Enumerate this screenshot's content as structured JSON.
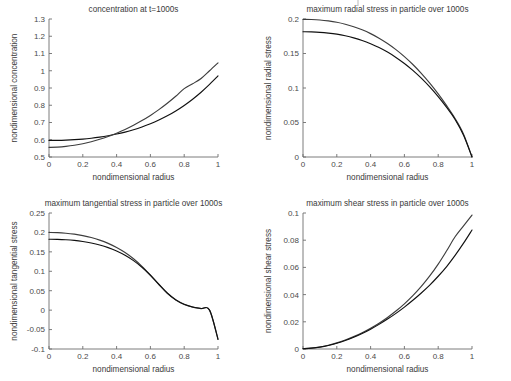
{
  "figure": {
    "width": 511,
    "height": 381,
    "background": "#ffffff",
    "layout": "2x2 subplot grid",
    "line_colors": [
      "#101010",
      "#3d3d3d"
    ]
  },
  "chart_data": [
    {
      "id": "concentration",
      "type": "line",
      "title": "concentration at t=1000s",
      "xlabel": "nondimensional radius",
      "ylabel": "nondimensional concentration",
      "xlim": [
        0,
        1
      ],
      "ylim": [
        0.5,
        1.3
      ],
      "xticks": [
        0,
        0.2,
        0.4,
        0.6,
        0.8,
        1
      ],
      "xticklabels": [
        "0",
        "0.2",
        "0.4",
        "0.6",
        "0.8",
        "1"
      ],
      "yticks": [
        0.5,
        0.6,
        0.7,
        0.8,
        0.9,
        1.0,
        1.1,
        1.2,
        1.3
      ],
      "yticklabels": [
        "0.5",
        "0.6",
        "0.7",
        "0.8",
        "0.9",
        "1",
        "1.1",
        "1.2",
        "1.3"
      ],
      "grid": false,
      "legend": "none",
      "x": [
        0,
        0.05,
        0.1,
        0.15,
        0.2,
        0.25,
        0.3,
        0.35,
        0.4,
        0.45,
        0.5,
        0.55,
        0.6,
        0.65,
        0.7,
        0.75,
        0.8,
        0.85,
        0.9,
        0.95,
        1
      ],
      "series": [
        {
          "name": "model-a",
          "color": "#101010",
          "values": [
            0.596,
            0.5965,
            0.598,
            0.6005,
            0.604,
            0.609,
            0.6155,
            0.6235,
            0.633,
            0.6445,
            0.658,
            0.674,
            0.6925,
            0.714,
            0.7385,
            0.767,
            0.799,
            0.835,
            0.8755,
            0.9205,
            0.97
          ]
        },
        {
          "name": "model-b",
          "color": "#3d3d3d",
          "values": [
            0.556,
            0.5575,
            0.5615,
            0.568,
            0.577,
            0.5885,
            0.6025,
            0.619,
            0.638,
            0.6595,
            0.684,
            0.711,
            0.741,
            0.7745,
            0.8115,
            0.852,
            0.8965,
            0.9245,
            0.9555,
            1.0,
            1.046
          ]
        }
      ]
    },
    {
      "id": "radial-stress",
      "type": "line",
      "title": "maximum radial stress in particle over 1000s",
      "xlabel": "nondimensional radius",
      "ylabel": "nondimensional radial stress",
      "xlim": [
        0,
        1
      ],
      "ylim": [
        0,
        0.2
      ],
      "xticks": [
        0,
        0.2,
        0.4,
        0.6,
        0.8,
        1
      ],
      "xticklabels": [
        "0",
        "0.2",
        "0.4",
        "0.6",
        "0.8",
        "1"
      ],
      "yticks": [
        0,
        0.05,
        0.1,
        0.15,
        0.2
      ],
      "yticklabels": [
        "0",
        "0.05",
        "0.1",
        "0.15",
        "0.2"
      ],
      "grid": false,
      "legend": "none",
      "x": [
        0,
        0.05,
        0.1,
        0.15,
        0.2,
        0.25,
        0.3,
        0.35,
        0.4,
        0.45,
        0.5,
        0.55,
        0.6,
        0.65,
        0.7,
        0.75,
        0.8,
        0.85,
        0.9,
        0.95,
        1
      ],
      "series": [
        {
          "name": "model-a",
          "color": "#3d3d3d",
          "values": [
            0.1995,
            0.1993,
            0.1986,
            0.1972,
            0.1952,
            0.1924,
            0.1888,
            0.1843,
            0.1788,
            0.1722,
            0.1645,
            0.1556,
            0.1455,
            0.1341,
            0.1213,
            0.1071,
            0.0915,
            0.0744,
            0.0558,
            0.0331,
            0.0
          ]
        },
        {
          "name": "model-b",
          "color": "#101010",
          "values": [
            0.1815,
            0.1813,
            0.1807,
            0.1796,
            0.178,
            0.1757,
            0.1727,
            0.1689,
            0.1642,
            0.1586,
            0.152,
            0.1443,
            0.1355,
            0.1255,
            0.1142,
            0.1016,
            0.0875,
            0.0718,
            0.0544,
            0.0314,
            0.0
          ]
        }
      ]
    },
    {
      "id": "tangential-stress",
      "type": "line",
      "title": "maximum tangential stress in particle over 1000s",
      "xlabel": "nondimensional radius",
      "ylabel": "nondimensional tangential stress",
      "xlim": [
        0,
        1
      ],
      "ylim": [
        -0.1,
        0.25
      ],
      "xticks": [
        0,
        0.2,
        0.4,
        0.6,
        0.8,
        1
      ],
      "xticklabels": [
        "0",
        "0.2",
        "0.4",
        "0.6",
        "0.8",
        "1"
      ],
      "yticks": [
        -0.1,
        -0.05,
        0,
        0.05,
        0.1,
        0.15,
        0.2,
        0.25
      ],
      "yticklabels": [
        "-0.1",
        "-0.05",
        "0",
        "0.05",
        "0.1",
        "0.15",
        "0.2",
        "0.25"
      ],
      "grid": false,
      "legend": "none",
      "x": [
        0,
        0.05,
        0.1,
        0.15,
        0.2,
        0.25,
        0.3,
        0.35,
        0.4,
        0.45,
        0.5,
        0.55,
        0.6,
        0.65,
        0.7,
        0.75,
        0.8,
        0.85,
        0.9,
        0.95,
        1
      ],
      "series": [
        {
          "name": "model-a",
          "color": "#3d3d3d",
          "values": [
            0.2,
            0.1995,
            0.198,
            0.1955,
            0.1918,
            0.1868,
            0.1802,
            0.1718,
            0.1612,
            0.1482,
            0.1322,
            0.1128,
            0.0902,
            0.0658,
            0.043,
            0.0258,
            0.0145,
            0.0078,
            0.004,
            0.0,
            -0.075
          ]
        },
        {
          "name": "model-b",
          "color": "#101010",
          "values": [
            0.1825,
            0.1822,
            0.1812,
            0.1794,
            0.1766,
            0.1727,
            0.1676,
            0.1609,
            0.1522,
            0.1412,
            0.1275,
            0.1104,
            0.0898,
            0.0666,
            0.0442,
            0.0268,
            0.0152,
            0.0082,
            0.0042,
            0.0,
            -0.075
          ]
        }
      ]
    },
    {
      "id": "shear-stress",
      "type": "line",
      "title": "maximum shear stress in particle over 1000s",
      "xlabel": "nondimensional radius",
      "ylabel": "nondimensional shear stress",
      "xlim": [
        0,
        1
      ],
      "ylim": [
        0,
        0.1
      ],
      "xticks": [
        0,
        0.2,
        0.4,
        0.6,
        0.8,
        1
      ],
      "xticklabels": [
        "0",
        "0.2",
        "0.4",
        "0.6",
        "0.8",
        "1"
      ],
      "yticks": [
        0,
        0.02,
        0.04,
        0.06,
        0.08,
        0.1
      ],
      "yticklabels": [
        "0",
        "0.02",
        "0.04",
        "0.06",
        "0.08",
        "0.1"
      ],
      "grid": false,
      "legend": "none",
      "x": [
        0,
        0.05,
        0.1,
        0.15,
        0.2,
        0.25,
        0.3,
        0.35,
        0.4,
        0.45,
        0.5,
        0.55,
        0.6,
        0.65,
        0.7,
        0.75,
        0.8,
        0.85,
        0.9,
        0.95,
        1
      ],
      "series": [
        {
          "name": "model-a",
          "color": "#3d3d3d",
          "values": [
            0.0002,
            0.0006,
            0.0015,
            0.0028,
            0.0045,
            0.0066,
            0.0091,
            0.012,
            0.0153,
            0.019,
            0.0232,
            0.0279,
            0.0332,
            0.0392,
            0.046,
            0.0537,
            0.0624,
            0.0722,
            0.0825,
            0.0905,
            0.0985
          ]
        },
        {
          "name": "model-b",
          "color": "#101010",
          "values": [
            0.0002,
            0.0006,
            0.0014,
            0.0026,
            0.0042,
            0.0062,
            0.0086,
            0.0114,
            0.0146,
            0.0181,
            0.022,
            0.0262,
            0.0308,
            0.0358,
            0.0412,
            0.047,
            0.0535,
            0.0606,
            0.0688,
            0.0778,
            0.0875
          ]
        }
      ]
    }
  ]
}
